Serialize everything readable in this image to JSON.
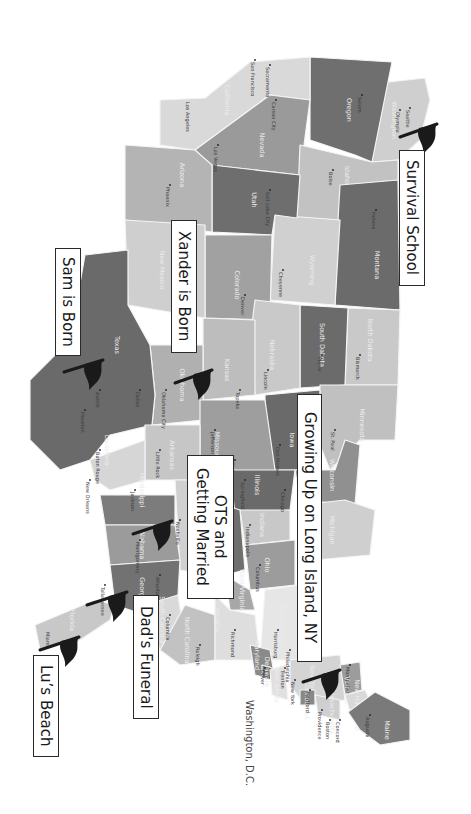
{
  "map": {
    "orientation": "rotated 90deg clockwise (north points right)",
    "background": "#ffffff",
    "flag_color": "#1a1a1a",
    "states": [
      {
        "name": "Washington",
        "fill": "#cfcfcf",
        "label_pos": [
          392,
          120
        ],
        "points": "380,83 425,78 430,100 420,140 398,160 372,162 370,120"
      },
      {
        "name": "Oregon",
        "fill": "#6f6f6f",
        "label_pos": [
          347,
          110
        ],
        "points": "310,57 392,62 372,162 355,155 310,140"
      },
      {
        "name": "California",
        "fill": "#d9d9d9",
        "label_pos": [
          225,
          100
        ],
        "points": "160,100 205,98 250,62 310,57 310,100 270,95 195,150 160,145"
      },
      {
        "name": "Nevada",
        "fill": "#9a9a9a",
        "label_pos": [
          260,
          145
        ],
        "points": "195,150 270,95 310,100 300,175 210,165"
      },
      {
        "name": "Idaho",
        "fill": "#c2c2c2",
        "label_pos": [
          345,
          175
        ],
        "points": "300,145 372,162 398,160 398,180 345,185 340,220 297,218"
      },
      {
        "name": "Montana",
        "fill": "#6b6b6b",
        "label_pos": [
          375,
          265
        ],
        "points": "340,185 398,180 400,310 335,305 338,220"
      },
      {
        "name": "Wyoming",
        "fill": "#d0d0d0",
        "label_pos": [
          310,
          270
        ],
        "points": "275,215 340,220 335,305 270,300"
      },
      {
        "name": "Utah",
        "fill": "#6e6e6e",
        "label_pos": [
          252,
          200
        ],
        "points": "212,165 300,175 297,218 275,215 272,235 212,232"
      },
      {
        "name": "Arizona",
        "fill": "#b4b4b4",
        "label_pos": [
          180,
          175
        ],
        "points": "125,145 195,150 212,165 212,232 125,220"
      },
      {
        "name": "Colorado",
        "fill": "#a1a1a1",
        "label_pos": [
          235,
          285
        ],
        "points": "205,235 272,235 270,320 205,318"
      },
      {
        "name": "New Mexico",
        "fill": "#cfcfcf",
        "label_pos": [
          160,
          270
        ],
        "points": "125,220 205,225 205,318 128,305"
      },
      {
        "name": "North Dakota",
        "fill": "#c9c9c9",
        "label_pos": [
          368,
          340
        ],
        "points": "348,308 400,310 398,385 345,385"
      },
      {
        "name": "South Dakota",
        "fill": "#6b6b6b",
        "label_pos": [
          320,
          345
        ],
        "points": "300,305 348,308 345,385 300,388"
      },
      {
        "name": "Nebraska",
        "fill": "#c9c9c9",
        "label_pos": [
          270,
          355
        ],
        "points": "255,300 300,305 300,388 255,395 250,340"
      },
      {
        "name": "Kansas",
        "fill": "#bdbdbd",
        "label_pos": [
          225,
          370
        ],
        "points": "203,318 255,320 255,395 203,400"
      },
      {
        "name": "Oklahoma",
        "fill": "#b0b0b0",
        "label_pos": [
          180,
          385
        ],
        "points": "150,345 203,345 203,420 152,425 155,395"
      },
      {
        "name": "Texas",
        "fill": "#6a6a6a",
        "label_pos": [
          115,
          345
        ],
        "points": "30,380 70,340 85,255 128,250 128,305 150,345 155,395 152,425 110,435 90,460 60,470 30,440"
      },
      {
        "name": "Minnesota",
        "fill": "#c0c0c0",
        "label_pos": [
          360,
          425
        ],
        "points": "320,385 398,385 395,440 360,440 330,470 318,440"
      },
      {
        "name": "Iowa",
        "fill": "#6a6a6a",
        "label_pos": [
          290,
          440
        ],
        "points": "265,395 320,390 318,470 275,470 265,440"
      },
      {
        "name": "Missouri",
        "fill": "#9e9e9e",
        "label_pos": [
          215,
          445
        ],
        "points": "200,400 265,400 275,470 240,490 200,480"
      },
      {
        "name": "Arkansas",
        "fill": "#c6c6c6",
        "label_pos": [
          170,
          455
        ],
        "points": "145,425 200,425 200,480 145,480"
      },
      {
        "name": "Louisiana",
        "fill": "#d6d6d6",
        "label_pos": [
          105,
          450
        ],
        "points": "90,460 145,440 145,480 110,490 95,480"
      },
      {
        "name": "Wisconsin",
        "fill": "#909090",
        "label_pos": [
          330,
          475
        ],
        "points": "295,470 335,470 345,440 360,445 355,505 300,500"
      },
      {
        "name": "Illinois",
        "fill": "#6a6a6a",
        "label_pos": [
          255,
          485
        ],
        "points": "230,470 295,470 290,510 235,515"
      },
      {
        "name": "Michigan",
        "fill": "#cfcfcf",
        "label_pos": [
          330,
          530
        ],
        "points": "300,505 345,500 375,510 370,555 315,560 300,540"
      },
      {
        "name": "Indiana",
        "fill": "#c8c8c8",
        "label_pos": [
          260,
          525
        ],
        "points": "240,510 290,510 290,540 245,545"
      },
      {
        "name": "Kentucky",
        "fill": "#6f6f6f",
        "label_pos": [
          225,
          545
        ],
        "points": "210,500 240,510 245,570 225,575 205,560"
      },
      {
        "name": "Tennessee",
        "fill": "#d0d0d0",
        "label_pos": [
          190,
          520
        ],
        "points": "175,480 210,480 210,575 180,570"
      },
      {
        "name": "Mississippi",
        "fill": "#7c7c7c",
        "label_pos": [
          140,
          490
        ],
        "points": "100,495 175,495 175,525 105,525"
      },
      {
        "name": "Alabama",
        "fill": "#9b9b9b",
        "label_pos": [
          140,
          545
        ],
        "points": "105,525 175,525 180,560 110,565"
      },
      {
        "name": "Georgia",
        "fill": "#727272",
        "label_pos": [
          140,
          590
        ],
        "points": "110,565 180,560 178,595 160,620 115,605"
      },
      {
        "name": "Florida",
        "fill": "#c8c8c8",
        "label_pos": [
          70,
          620
        ],
        "points": "35,625 95,600 115,605 110,620 80,640 40,650"
      },
      {
        "name": "South Carolina",
        "fill": "#d9d9d9",
        "label_pos": [
          160,
          620
        ],
        "points": "145,605 178,595 185,640 160,650"
      },
      {
        "name": "North Carolina",
        "fill": "#c2c2c2",
        "label_pos": [
          185,
          640
        ],
        "points": "160,650 185,605 215,615 215,660 180,665"
      },
      {
        "name": "Ohio",
        "fill": "#9c9c9c",
        "label_pos": [
          265,
          565
        ],
        "points": "245,545 295,540 295,585 250,590"
      },
      {
        "name": "West Virginia",
        "fill": "#a7a7a7",
        "label_pos": [
          240,
          590
        ],
        "points": "225,575 250,590 255,610 230,610"
      },
      {
        "name": "Virginia",
        "fill": "#dedede",
        "label_pos": [
          215,
          620
        ],
        "points": "215,595 230,610 255,615 260,660 215,660"
      },
      {
        "name": "Pennsylvania",
        "fill": "#e6e6e6",
        "label_pos": [
          280,
          625
        ],
        "points": "265,590 300,585 300,660 260,660"
      },
      {
        "name": "Maryland",
        "fill": "#8a8a8a",
        "label_pos": [
          255,
          655
        ],
        "points": "250,645 270,650 275,680 255,675"
      },
      {
        "name": "Delaware",
        "fill": "#6d6d6d",
        "label_pos": [
          265,
          672
        ],
        "points": "262,665 272,668 272,680 262,678"
      },
      {
        "name": "New Jersey",
        "fill": "#e0e0e0",
        "label_pos": [
          275,
          685
        ],
        "points": "270,670 285,665 288,700 272,695"
      },
      {
        "name": "New York",
        "fill": "#d4d4d4",
        "label_pos": [
          310,
          680
        ],
        "points": "290,660 340,655 345,700 305,705 290,685"
      },
      {
        "name": "Connecticut",
        "fill": "#888888",
        "label_pos": [
          305,
          700
        ],
        "points": "300,690 315,690 315,705 300,705"
      },
      {
        "name": "Massachusetts",
        "fill": "#cfcfcf",
        "label_pos": [
          330,
          710
        ],
        "points": "315,695 340,700 340,720 318,715"
      },
      {
        "name": "Vermont",
        "fill": "#9c9c9c",
        "label_pos": [
          345,
          690
        ],
        "points": "340,665 360,662 362,690 345,695"
      },
      {
        "name": "New Hampshire",
        "fill": "#d9d9d9",
        "label_pos": [
          355,
          705
        ],
        "points": "345,695 365,690 372,705 350,712"
      },
      {
        "name": "Maine",
        "fill": "#7a7a7a",
        "label_pos": [
          385,
          730
        ],
        "points": "348,712 375,692 410,710 410,740 380,745 360,730"
      }
    ],
    "cities": [
      {
        "name": "Seattle",
        "pos": [
          410,
          108
        ],
        "dot": true
      },
      {
        "name": "Olympia",
        "pos": [
          400,
          110
        ],
        "dot": true
      },
      {
        "name": "Salem",
        "pos": [
          362,
          95
        ],
        "dot": true
      },
      {
        "name": "Sacramento",
        "pos": [
          270,
          65
        ],
        "dot": true
      },
      {
        "name": "San Francisco",
        "pos": [
          255,
          60
        ],
        "dot": true
      },
      {
        "name": "Carson City",
        "pos": [
          276,
          100
        ],
        "dot": true
      },
      {
        "name": "Las Vegas",
        "pos": [
          218,
          145
        ],
        "dot": true
      },
      {
        "name": "Los Angeles",
        "pos": [
          190,
          100
        ],
        "dot": false
      },
      {
        "name": "Boise",
        "pos": [
          333,
          170
        ],
        "dot": true
      },
      {
        "name": "Helena",
        "pos": [
          376,
          210
        ],
        "dot": true
      },
      {
        "name": "Salt Lake City",
        "pos": [
          270,
          190
        ],
        "dot": true
      },
      {
        "name": "Phoenix",
        "pos": [
          170,
          185
        ],
        "dot": true
      },
      {
        "name": "Cheyenne",
        "pos": [
          283,
          270
        ],
        "dot": true
      },
      {
        "name": "Denver",
        "pos": [
          245,
          295
        ],
        "dot": true
      },
      {
        "name": "Bismarck",
        "pos": [
          360,
          355
        ],
        "dot": true
      },
      {
        "name": "Pierre",
        "pos": [
          322,
          355
        ],
        "dot": true
      },
      {
        "name": "Lincoln",
        "pos": [
          268,
          370
        ],
        "dot": true
      },
      {
        "name": "Topeka",
        "pos": [
          240,
          390
        ],
        "dot": true
      },
      {
        "name": "Oklahoma City",
        "pos": [
          166,
          390
        ],
        "dot": true
      },
      {
        "name": "Dallas",
        "pos": [
          140,
          390
        ],
        "dot": true
      },
      {
        "name": "Austin",
        "pos": [
          100,
          390
        ],
        "dot": true
      },
      {
        "name": "Houston",
        "pos": [
          85,
          410
        ],
        "dot": true
      },
      {
        "name": "St. Paul",
        "pos": [
          335,
          430
        ],
        "dot": true
      },
      {
        "name": "Des Moines",
        "pos": [
          280,
          445
        ],
        "dot": true
      },
      {
        "name": "Jefferson City",
        "pos": [
          215,
          430
        ],
        "dot": true
      },
      {
        "name": "St. Louis",
        "pos": [
          235,
          460
        ],
        "dot": true
      },
      {
        "name": "Little Rock",
        "pos": [
          160,
          450
        ],
        "dot": true
      },
      {
        "name": "Baton Rouge",
        "pos": [
          100,
          450
        ],
        "dot": true
      },
      {
        "name": "New Orleans",
        "pos": [
          90,
          480
        ],
        "dot": true
      },
      {
        "name": "Jackson",
        "pos": [
          135,
          490
        ],
        "dot": true
      },
      {
        "name": "Springfield",
        "pos": [
          245,
          480
        ],
        "dot": true
      },
      {
        "name": "Chicago",
        "pos": [
          285,
          490
        ],
        "dot": true
      },
      {
        "name": "Nashville",
        "pos": [
          180,
          520
        ],
        "dot": true
      },
      {
        "name": "Montgomery",
        "pos": [
          140,
          540
        ],
        "dot": true
      },
      {
        "name": "Indianapolis",
        "pos": [
          250,
          525
        ],
        "dot": true
      },
      {
        "name": "Columbus",
        "pos": [
          260,
          565
        ],
        "dot": true
      },
      {
        "name": "Atlanta",
        "pos": [
          160,
          575
        ],
        "dot": true
      },
      {
        "name": "Tallahassee",
        "pos": [
          105,
          585
        ],
        "dot": true
      },
      {
        "name": "Miami",
        "pos": [
          50,
          630
        ],
        "dot": false
      },
      {
        "name": "Columbia",
        "pos": [
          170,
          615
        ],
        "dot": true
      },
      {
        "name": "Raleigh",
        "pos": [
          200,
          645
        ],
        "dot": true
      },
      {
        "name": "Richmond",
        "pos": [
          235,
          630
        ],
        "dot": true
      },
      {
        "name": "Harrisburg",
        "pos": [
          278,
          630
        ],
        "dot": true
      },
      {
        "name": "Philadelphia",
        "pos": [
          290,
          650
        ],
        "dot": true
      },
      {
        "name": "Dover",
        "pos": [
          265,
          668
        ],
        "dot": true
      },
      {
        "name": "Trenton",
        "pos": [
          285,
          668
        ],
        "dot": true
      },
      {
        "name": "New York",
        "pos": [
          295,
          680
        ],
        "dot": true
      },
      {
        "name": "Hartford",
        "pos": [
          310,
          690
        ],
        "dot": true
      },
      {
        "name": "Providence",
        "pos": [
          322,
          710
        ],
        "dot": true
      },
      {
        "name": "Boston",
        "pos": [
          330,
          720
        ],
        "dot": true
      },
      {
        "name": "Concord",
        "pos": [
          340,
          720
        ],
        "dot": true
      },
      {
        "name": "Montpelier",
        "pos": [
          350,
          665
        ],
        "dot": true
      },
      {
        "name": "Augusta",
        "pos": [
          370,
          715
        ],
        "dot": true
      }
    ],
    "washington_dc_label": "Washington, D.C."
  },
  "events": [
    {
      "id": "survival-school",
      "label": "Survival School",
      "box": {
        "x": 399,
        "y": 150,
        "w": 26,
        "h": 136
      },
      "flag": {
        "pole_x": 400,
        "pole_y": 137,
        "tip_x": 437,
        "tip_y": 124
      }
    },
    {
      "id": "xander-born",
      "label": "Xander is Born",
      "box": {
        "x": 171,
        "y": 220,
        "w": 26,
        "h": 133
      },
      "flag": {
        "pole_x": 175,
        "pole_y": 383,
        "tip_x": 212,
        "tip_y": 370
      }
    },
    {
      "id": "sam-born",
      "label": "Sam is Born",
      "box": {
        "x": 55,
        "y": 248,
        "w": 26,
        "h": 108
      },
      "flag": {
        "pole_x": 64,
        "pole_y": 372,
        "tip_x": 103,
        "tip_y": 360
      }
    },
    {
      "id": "long-island",
      "label": "Growing Up on Long Island, NY",
      "box": {
        "x": 297,
        "y": 394,
        "w": 25,
        "h": 268
      },
      "flag": {
        "pole_x": 303,
        "pole_y": 682,
        "tip_x": 340,
        "tip_y": 670
      }
    },
    {
      "id": "ots-married",
      "label": "OTS and\nGetting Married",
      "box": {
        "x": 187,
        "y": 455,
        "w": 47,
        "h": 144
      },
      "flag": {
        "pole_x": 133,
        "pole_y": 534,
        "tip_x": 172,
        "tip_y": 521
      }
    },
    {
      "id": "dads-funeral",
      "label": "Dad's Funeral",
      "box": {
        "x": 133,
        "y": 595,
        "w": 26,
        "h": 124
      },
      "flag": {
        "pole_x": 87,
        "pole_y": 605,
        "tip_x": 127,
        "tip_y": 592
      }
    },
    {
      "id": "lus-beach",
      "label": "Lu’s Beach",
      "box": {
        "x": 33,
        "y": 655,
        "w": 26,
        "h": 102
      },
      "flag": {
        "pole_x": 40,
        "pole_y": 650,
        "tip_x": 79,
        "tip_y": 637
      }
    }
  ]
}
